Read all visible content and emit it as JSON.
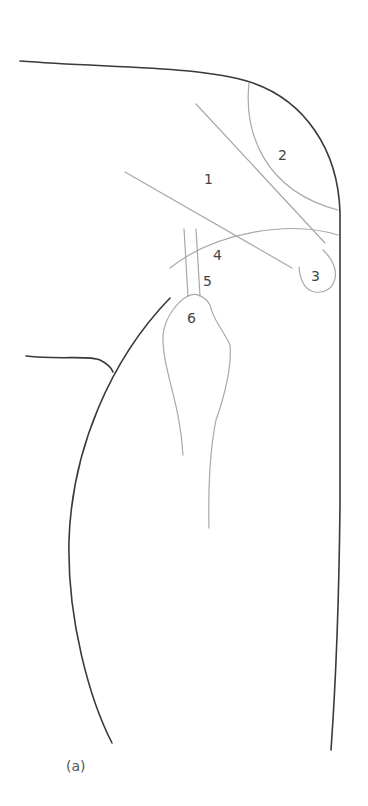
{
  "figure": {
    "caption": "(a)",
    "labels": [
      {
        "id": "1",
        "text": "1"
      },
      {
        "id": "2",
        "text": "2"
      },
      {
        "id": "3",
        "text": "3"
      },
      {
        "id": "4",
        "text": "4"
      },
      {
        "id": "5",
        "text": "5"
      },
      {
        "id": "6",
        "text": "6"
      }
    ],
    "colors": {
      "outline": "#3a3a3a",
      "inner_structures": "#a8a8a8",
      "label_text": "#444444",
      "background": "#ffffff"
    }
  }
}
